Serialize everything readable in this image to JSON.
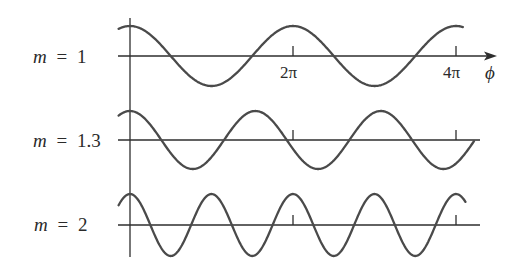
{
  "figure": {
    "rows": [
      {
        "label_var": "m",
        "label_eq": "=",
        "label_val": "1"
      },
      {
        "label_var": "m",
        "label_eq": "=",
        "label_val": "1.3"
      },
      {
        "label_var": "m",
        "label_eq": "=",
        "label_val": "2"
      }
    ],
    "ticks": {
      "t1": "2π",
      "t2": "4π"
    },
    "axis_label": "ϕ"
  },
  "chart_data": {
    "type": "line",
    "title": "",
    "xlabel": "ϕ",
    "ylabel": "",
    "function": "cos(m·ϕ)",
    "x_ticks": [
      "2π",
      "4π"
    ],
    "x_tick_values_rad": [
      6.2832,
      12.5664
    ],
    "x_range_rad": [
      -0.44,
      13.0
    ],
    "grid": false,
    "legend": null,
    "series": [
      {
        "name": "m = 1",
        "m": 1.0,
        "amplitude": 1,
        "x_end_rad": 12.83
      },
      {
        "name": "m = 1.3",
        "m": 1.3,
        "amplitude": 1,
        "x_end_rad": 13.26
      },
      {
        "name": "m = 2",
        "m": 2.0,
        "amplitude": 1,
        "x_end_rad": 12.93
      }
    ],
    "colors": {
      "curve": "#4a4a4a",
      "axis": "#2e2e2e"
    }
  }
}
